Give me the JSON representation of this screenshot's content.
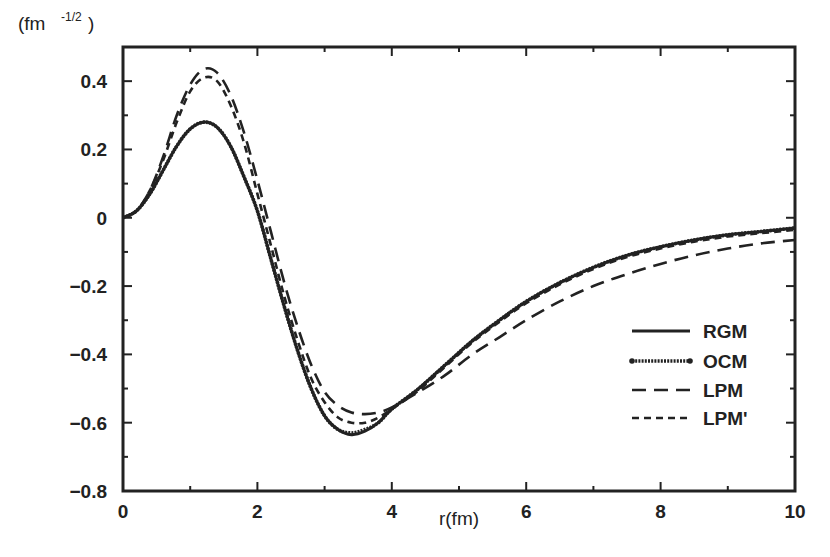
{
  "chart_data": {
    "type": "line",
    "title": "",
    "xlabel": "r(fm)",
    "ylabel": "(fm -1/2)",
    "ylabel_base": "(fm",
    "ylabel_sup": "-1/2",
    "ylabel_close": ")",
    "xlim": [
      0,
      10
    ],
    "ylim": [
      -0.8,
      0.5
    ],
    "x_ticks": [
      0,
      2,
      4,
      6,
      8,
      10
    ],
    "x_tick_labels": [
      "0",
      "2",
      "4",
      "6",
      "8",
      "10"
    ],
    "y_ticks": [
      0.4,
      0.2,
      0,
      -0.2,
      -0.4,
      -0.6,
      -0.8
    ],
    "y_tick_labels": [
      "0.4",
      "0.2",
      "0",
      "−0.2",
      "−0.4",
      "−0.6",
      "−0.8"
    ],
    "grid": false,
    "legend_position": "lower right",
    "series": [
      {
        "name": "RGM",
        "style": "solid",
        "x": [
          0,
          0.2,
          0.4,
          0.6,
          0.8,
          1.0,
          1.2,
          1.4,
          1.6,
          1.8,
          2.0,
          2.2,
          2.4,
          2.6,
          2.8,
          3.0,
          3.2,
          3.4,
          3.6,
          3.8,
          4.0,
          4.4,
          4.8,
          5.2,
          5.6,
          6.0,
          6.5,
          7.0,
          7.5,
          8.0,
          8.5,
          9.0,
          9.5,
          10.0
        ],
        "y": [
          0,
          0.02,
          0.07,
          0.14,
          0.21,
          0.26,
          0.28,
          0.265,
          0.21,
          0.12,
          0.02,
          -0.12,
          -0.26,
          -0.39,
          -0.5,
          -0.58,
          -0.62,
          -0.635,
          -0.625,
          -0.6,
          -0.56,
          -0.5,
          -0.43,
          -0.36,
          -0.3,
          -0.245,
          -0.19,
          -0.145,
          -0.11,
          -0.085,
          -0.065,
          -0.05,
          -0.04,
          -0.03
        ]
      },
      {
        "name": "OCM",
        "style": "dotted-solid",
        "x": [
          0,
          0.2,
          0.4,
          0.6,
          0.8,
          1.0,
          1.2,
          1.4,
          1.6,
          1.8,
          2.0,
          2.2,
          2.4,
          2.6,
          2.8,
          3.0,
          3.2,
          3.4,
          3.6,
          3.8,
          4.0,
          4.4,
          4.8,
          5.2,
          5.6,
          6.0,
          6.5,
          7.0,
          7.5,
          8.0,
          8.5,
          9.0,
          9.5,
          10.0
        ],
        "y": [
          0,
          0.02,
          0.07,
          0.14,
          0.21,
          0.26,
          0.28,
          0.265,
          0.21,
          0.12,
          0.02,
          -0.12,
          -0.26,
          -0.39,
          -0.5,
          -0.58,
          -0.62,
          -0.63,
          -0.62,
          -0.6,
          -0.56,
          -0.5,
          -0.43,
          -0.36,
          -0.3,
          -0.245,
          -0.19,
          -0.145,
          -0.11,
          -0.085,
          -0.065,
          -0.05,
          -0.04,
          -0.03
        ]
      },
      {
        "name": "LPM",
        "style": "long-dash",
        "x": [
          0,
          0.2,
          0.4,
          0.6,
          0.8,
          1.0,
          1.2,
          1.4,
          1.6,
          1.8,
          2.0,
          2.2,
          2.4,
          2.6,
          2.8,
          3.0,
          3.2,
          3.4,
          3.6,
          3.8,
          4.0,
          4.4,
          4.8,
          5.2,
          5.6,
          6.0,
          6.5,
          7.0,
          7.5,
          8.0,
          8.5,
          9.0,
          9.5,
          10.0
        ],
        "y": [
          0,
          0.02,
          0.08,
          0.18,
          0.3,
          0.39,
          0.435,
          0.425,
          0.36,
          0.25,
          0.11,
          -0.04,
          -0.19,
          -0.32,
          -0.43,
          -0.51,
          -0.55,
          -0.57,
          -0.575,
          -0.57,
          -0.555,
          -0.51,
          -0.46,
          -0.4,
          -0.35,
          -0.3,
          -0.245,
          -0.2,
          -0.165,
          -0.135,
          -0.11,
          -0.09,
          -0.075,
          -0.065
        ]
      },
      {
        "name": "LPM'",
        "style": "short-dash",
        "x": [
          0,
          0.2,
          0.4,
          0.6,
          0.8,
          1.0,
          1.2,
          1.4,
          1.6,
          1.8,
          2.0,
          2.2,
          2.4,
          2.6,
          2.8,
          3.0,
          3.2,
          3.4,
          3.6,
          3.8,
          4.0,
          4.4,
          4.8,
          5.2,
          5.6,
          6.0,
          6.5,
          7.0,
          7.5,
          8.0,
          8.5,
          9.0,
          9.5,
          10.0
        ],
        "y": [
          0,
          0.02,
          0.08,
          0.17,
          0.28,
          0.37,
          0.41,
          0.4,
          0.33,
          0.22,
          0.07,
          -0.08,
          -0.23,
          -0.36,
          -0.47,
          -0.54,
          -0.585,
          -0.6,
          -0.6,
          -0.585,
          -0.56,
          -0.505,
          -0.435,
          -0.365,
          -0.305,
          -0.25,
          -0.195,
          -0.15,
          -0.115,
          -0.09,
          -0.07,
          -0.055,
          -0.045,
          -0.035
        ]
      }
    ]
  },
  "legend": {
    "items": [
      {
        "label": "RGM",
        "style": "solid"
      },
      {
        "label": "OCM",
        "style": "dotted-solid"
      },
      {
        "label": "LPM",
        "style": "long-dash"
      },
      {
        "label": "LPM'",
        "style": "short-dash"
      }
    ]
  },
  "colors": {
    "line": "#222222",
    "background": "#ffffff"
  }
}
